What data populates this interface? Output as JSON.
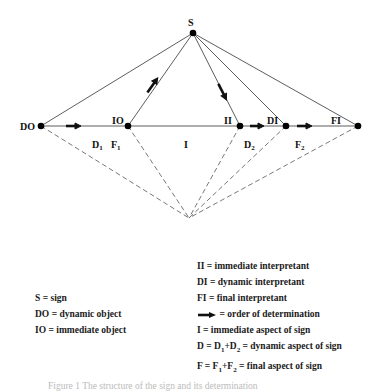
{
  "diagram": {
    "nodes": {
      "S": {
        "label": "S",
        "x": 193,
        "y": 33
      },
      "DO": {
        "label": "DO",
        "x": 41,
        "y": 126
      },
      "IO": {
        "label": "IO",
        "x": 128,
        "y": 126
      },
      "II": {
        "label": "II",
        "x": 240,
        "y": 126
      },
      "DI": {
        "label": "DI",
        "x": 286,
        "y": 126
      },
      "FI": {
        "label": "FI",
        "x": 358,
        "y": 126
      },
      "apex": {
        "x": 189,
        "y": 218
      }
    },
    "region_labels": {
      "D1": "D",
      "D1_sub": "1",
      "F1": "F",
      "F1_sub": "1",
      "I": "I",
      "D2": "D",
      "D2_sub": "2",
      "F2": "F",
      "F2_sub": "2"
    }
  },
  "legend": {
    "left": [
      "S = sign",
      "DO = dynamic object",
      "IO = immediate object"
    ],
    "right": {
      "ii": "II = immediate interpretant",
      "di": "DI = dynamic interpretant",
      "fi": "FI = final interpretant",
      "arrow": "= order of determination",
      "i": "I = immediate aspect of sign",
      "d_prefix": "D = D",
      "d_mid": "+D",
      "d_suffix": " = dynamic aspect of sign",
      "f_prefix": "F = F",
      "f_mid": "+F",
      "f_suffix": " = final aspect of sign",
      "sub1": "1",
      "sub2": "2"
    }
  },
  "caption": "Figure 1  The structure of the sign and its determination"
}
